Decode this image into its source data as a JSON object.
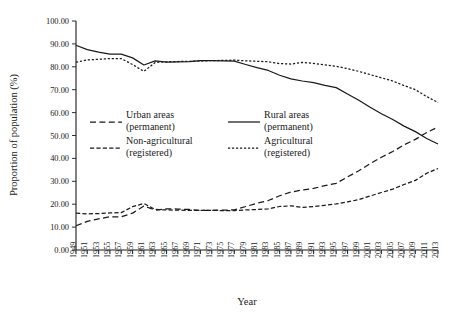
{
  "chart_data": {
    "type": "line",
    "title": "",
    "xlabel": "Year",
    "ylabel": "Proportion of population (%)",
    "xlim": [
      1949,
      2013
    ],
    "ylim": [
      0,
      100
    ],
    "grid": false,
    "legend_position": "inside-center-left",
    "ytick_labels": [
      "0.00",
      "10.00",
      "20.00",
      "30.00",
      "40.00",
      "50.00",
      "60.00",
      "70.00",
      "80.00",
      "90.00",
      "100.00"
    ],
    "ytick_values": [
      0,
      10,
      20,
      30,
      40,
      50,
      60,
      70,
      80,
      90,
      100
    ],
    "xtick_labels": [
      "1949",
      "1951",
      "1953",
      "1955",
      "1957",
      "1959",
      "1961",
      "1963",
      "1965",
      "1967",
      "1969",
      "1971",
      "1973",
      "1975",
      "1977",
      "1979",
      "1981",
      "1983",
      "1985",
      "1987",
      "1989",
      "1991",
      "1993",
      "1995",
      "1997",
      "1999",
      "2001",
      "2003",
      "2005",
      "2007",
      "2009",
      "2011",
      "2013"
    ],
    "x": [
      1949,
      1951,
      1953,
      1955,
      1957,
      1959,
      1961,
      1963,
      1965,
      1967,
      1969,
      1971,
      1973,
      1975,
      1977,
      1979,
      1981,
      1983,
      1985,
      1987,
      1989,
      1991,
      1993,
      1995,
      1997,
      1999,
      2001,
      2003,
      2005,
      2007,
      2009,
      2011,
      2013
    ],
    "series": [
      {
        "name": "Rural areas (permanent)",
        "key": "rural_permanent",
        "style": "solid",
        "values": [
          89.4,
          87.5,
          86.4,
          85.5,
          85.5,
          83.9,
          80.8,
          82.6,
          82.0,
          82.1,
          82.3,
          82.7,
          82.7,
          82.6,
          82.5,
          81.0,
          79.6,
          78.4,
          76.3,
          74.7,
          73.8,
          73.1,
          71.9,
          70.9,
          68.1,
          65.4,
          62.3,
          59.5,
          57.0,
          54.1,
          51.7,
          48.7,
          46.3
        ]
      },
      {
        "name": "Agricultural (registered)",
        "key": "agricultural_registered",
        "style": "dotted",
        "values": [
          82.0,
          83.0,
          83.3,
          83.6,
          83.6,
          81.0,
          78.0,
          81.9,
          82.2,
          82.3,
          82.4,
          82.5,
          82.7,
          82.8,
          82.9,
          82.6,
          82.4,
          82.2,
          81.4,
          81.2,
          81.9,
          81.5,
          80.8,
          80.2,
          79.2,
          78.0,
          76.6,
          75.2,
          73.8,
          71.8,
          70.0,
          67.0,
          64.4
        ]
      },
      {
        "name": "Urban areas (permanent)",
        "key": "urban_permanent",
        "style": "long-dash",
        "values": [
          10.6,
          12.5,
          13.6,
          14.5,
          14.5,
          16.1,
          19.2,
          17.4,
          18.0,
          17.9,
          17.7,
          17.3,
          17.3,
          17.4,
          17.5,
          19.0,
          20.4,
          21.6,
          23.7,
          25.3,
          26.2,
          26.9,
          28.1,
          29.1,
          31.9,
          34.6,
          37.7,
          40.5,
          43.0,
          45.9,
          48.3,
          51.3,
          53.7
        ]
      },
      {
        "name": "Non-agricultural (registered)",
        "key": "nonagricultural_registered",
        "style": "dash",
        "values": [
          16.1,
          15.8,
          15.9,
          16.2,
          16.3,
          18.9,
          20.3,
          17.7,
          17.5,
          17.4,
          17.3,
          17.3,
          17.3,
          17.2,
          17.2,
          17.5,
          17.7,
          18.0,
          19.0,
          19.3,
          18.6,
          19.0,
          19.5,
          20.1,
          21.0,
          22.0,
          23.6,
          25.1,
          26.6,
          28.6,
          30.4,
          33.5,
          35.6
        ]
      }
    ]
  }
}
